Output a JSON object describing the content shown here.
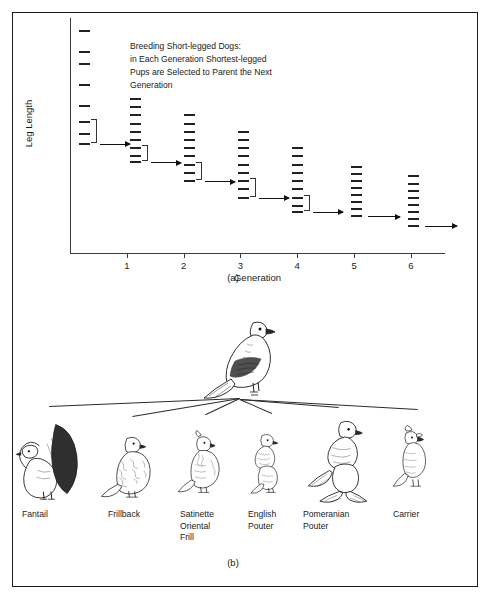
{
  "figure": {
    "panel_a_letter": "(a)",
    "panel_b_letter": "(b)"
  },
  "panel_a": {
    "caption_lines": [
      "Breeding Short-legged Dogs:",
      "in Each Generation Shortest-legged",
      "Pups are Selected to Parent the Next",
      "Generation"
    ],
    "y_axis_label": "Leg Length",
    "x_axis_label": "Generation",
    "x_ticks": [
      "1",
      "2",
      "3",
      "4",
      "5",
      "6"
    ]
  },
  "chart_data": {
    "type": "scatter",
    "xlabel": "Generation",
    "ylabel": "Leg Length",
    "xlim": [
      0,
      6.6
    ],
    "ylim": [
      0,
      10
    ],
    "grid": false,
    "legend": false,
    "note": "Each horizontal dash is one individual dog. Value = relative leg length (arbitrary units, higher = longer leg). A bracket marks the shortest-legged subset selected to parent the next generation; an arrow leads to that next generation.",
    "generations": [
      {
        "generation": 0,
        "x": 0.15,
        "leg_lengths": [
          9.5,
          8.6,
          8.1,
          7.2,
          6.3,
          5.6,
          5.1,
          4.7
        ],
        "spread": "wide",
        "selected_count": 3,
        "has_bracket": true,
        "has_arrow": true
      },
      {
        "generation": 1,
        "x": 1.05,
        "leg_lengths": [
          6.6,
          6.25,
          5.9,
          5.55,
          5.2,
          4.85,
          4.5,
          4.15,
          3.9
        ],
        "spread": "narrow",
        "selected_count": 3,
        "has_bracket": true,
        "has_arrow": true
      },
      {
        "generation": 2,
        "x": 2.0,
        "leg_lengths": [
          5.9,
          5.55,
          5.2,
          4.85,
          4.5,
          4.15,
          3.8,
          3.45,
          3.1
        ],
        "spread": "narrow",
        "selected_count": 3,
        "has_bracket": true,
        "has_arrow": true
      },
      {
        "generation": 3,
        "x": 2.95,
        "leg_lengths": [
          5.2,
          4.85,
          4.5,
          4.15,
          3.8,
          3.45,
          3.1,
          2.75,
          2.4
        ],
        "spread": "narrow",
        "selected_count": 3,
        "has_bracket": true,
        "has_arrow": true
      },
      {
        "generation": 4,
        "x": 3.9,
        "leg_lengths": [
          4.5,
          4.15,
          3.8,
          3.45,
          3.1,
          2.75,
          2.4,
          2.05,
          1.8
        ],
        "spread": "narrow",
        "selected_count": 3,
        "has_bracket": true,
        "has_arrow": true
      },
      {
        "generation": 5,
        "x": 4.95,
        "leg_lengths": [
          3.7,
          3.4,
          3.1,
          2.8,
          2.5,
          2.2,
          1.9,
          1.6
        ],
        "spread": "narrow",
        "selected_count": 0,
        "has_bracket": false,
        "has_arrow": true
      },
      {
        "generation": 6,
        "x": 5.95,
        "leg_lengths": [
          3.3,
          3.0,
          2.7,
          2.4,
          2.1,
          1.8,
          1.5,
          1.2
        ],
        "spread": "narrow",
        "selected_count": 0,
        "has_bracket": false,
        "has_arrow": true
      }
    ]
  },
  "panel_b": {
    "ancestor_name": "rock-pigeon-ancestor",
    "breeds": [
      {
        "label_lines": [
          "Fantail"
        ]
      },
      {
        "label_lines": [
          "Frillback"
        ]
      },
      {
        "label_lines": [
          "Satinette",
          "Oriental",
          "Frill"
        ]
      },
      {
        "label_lines": [
          "English",
          "Pouter"
        ]
      },
      {
        "label_lines": [
          "Pomeranian",
          "Pouter"
        ]
      },
      {
        "label_lines": [
          "Carrier"
        ]
      }
    ]
  }
}
